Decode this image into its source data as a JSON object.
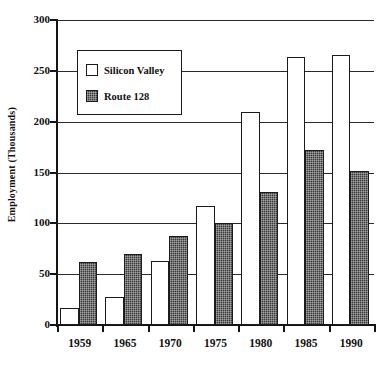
{
  "chart_data": {
    "type": "bar",
    "title": "",
    "xlabel": "",
    "ylabel": "Employment (Thousands)",
    "categories": [
      "1959",
      "1965",
      "1970",
      "1975",
      "1980",
      "1985",
      "1990"
    ],
    "series": [
      {
        "name": "Silicon Valley",
        "values": [
          17,
          28,
          63,
          117,
          210,
          264,
          266
        ],
        "fill": "#ffffff",
        "pattern": "solid-white-outline"
      },
      {
        "name": "Route 128",
        "values": [
          62,
          70,
          88,
          100,
          131,
          172,
          151
        ],
        "fill": "#3a3a3a",
        "pattern": "dark-hatch"
      }
    ],
    "ylim": [
      0,
      300
    ],
    "yticks": [
      0,
      50,
      100,
      150,
      200,
      250,
      300
    ],
    "ytick_labels": [
      "0",
      "50",
      "100",
      "150",
      "200",
      "250",
      "300"
    ],
    "grid": true,
    "grid_axis": "y",
    "legend_position": "upper-left-inside",
    "legend_entries": [
      "Silicon Valley",
      "Route 128"
    ],
    "axis_colors": {
      "axis": "#141414",
      "grid": "#2a2a2a",
      "bar_outline": "#1b1b1b"
    }
  }
}
